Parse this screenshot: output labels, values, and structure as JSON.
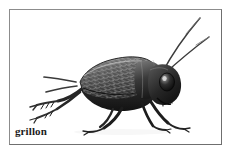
{
  "plate": {
    "caption": "grillon",
    "caption_language": "fr",
    "frame_color": "#8c8c8c",
    "background_color": "#ffffff"
  },
  "illustration": {
    "subject": "cricket",
    "style": "grayscale engraving",
    "orientation": "facing right, side view",
    "ink_color": "#2a2a2a",
    "midtone_color": "#6b6b6b",
    "highlight_color": "#d8d8d8",
    "parts": [
      {
        "name": "antenna-long-upper",
        "description": "long thin antenna sweeping up to top-right corner"
      },
      {
        "name": "antenna-long-lower",
        "description": "second antenna curving up and right"
      },
      {
        "name": "head",
        "description": "dark rounded head with large compound eye"
      },
      {
        "name": "eye",
        "description": "dark oval eye with light highlight"
      },
      {
        "name": "pronotum",
        "description": "segmented plate behind head"
      },
      {
        "name": "forewing",
        "description": "textured wing with cross-hatched vein scales"
      },
      {
        "name": "abdomen",
        "description": "dark body mass under wing"
      },
      {
        "name": "cerci",
        "description": "two tail appendages at rear left"
      },
      {
        "name": "hind-leg",
        "description": "large jumping leg with spined tibia"
      },
      {
        "name": "middle-leg",
        "description": "slender walking leg"
      },
      {
        "name": "front-leg",
        "description": "slender front leg with tarsus"
      }
    ]
  }
}
